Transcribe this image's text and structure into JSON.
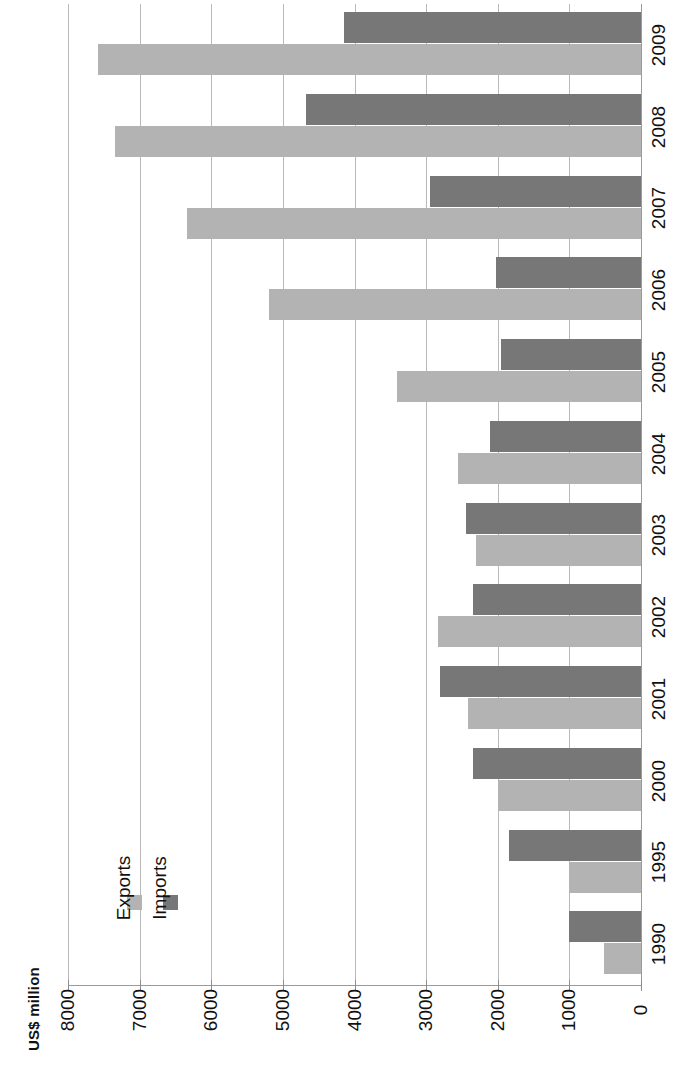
{
  "chart_data": {
    "type": "bar",
    "title": "",
    "subtitle": "",
    "orientation": "rotated-90",
    "xlabel": "",
    "ylabel": "US$ million",
    "ylim": [
      0,
      8000
    ],
    "ytick_step": 1000,
    "yticks": [
      "8000",
      "7000",
      "6000",
      "5000",
      "4000",
      "3000",
      "2000",
      "1000",
      "0"
    ],
    "grid": true,
    "legend_position": "inside-left",
    "categories": [
      "1990",
      "1995",
      "2000",
      "2001",
      "2002",
      "2003",
      "2004",
      "2005",
      "2006",
      "2007",
      "2008",
      "2009"
    ],
    "series": [
      {
        "name": "Exports",
        "color": "#b3b3b3",
        "values": [
          510,
          1000,
          2000,
          2420,
          2840,
          2300,
          2560,
          3410,
          5200,
          6340,
          7340,
          7580
        ]
      },
      {
        "name": "Imports",
        "color": "#777777",
        "values": [
          1000,
          1850,
          2350,
          2800,
          2350,
          2450,
          2110,
          1950,
          2020,
          2940,
          4680,
          4140
        ]
      }
    ]
  },
  "axis": {
    "value_axis_label": "US$ million"
  },
  "legend": {
    "items": [
      {
        "label": "Exports",
        "color": "#b3b3b3",
        "icon": "square-swatch-icon"
      },
      {
        "label": "Imports",
        "color": "#777777",
        "icon": "square-swatch-icon"
      }
    ]
  },
  "colors": {
    "exports": "#b3b3b3",
    "imports": "#777777",
    "gridline": "#b9b9b9",
    "axis": "#9a9a9a",
    "text": "#111111",
    "background": "#ffffff"
  }
}
